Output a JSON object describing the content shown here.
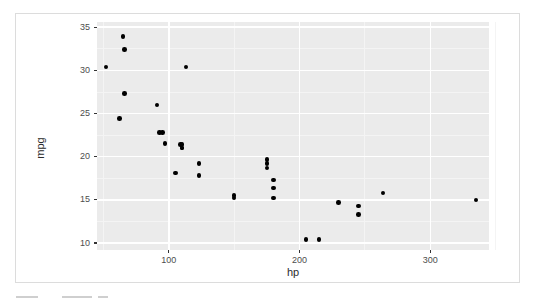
{
  "chart_data": {
    "type": "scatter",
    "title": "",
    "subtitle": "",
    "xlabel": "hp",
    "ylabel": "mpg",
    "xlim": [
      45,
      345
    ],
    "ylim": [
      9.2,
      35.6
    ],
    "x_ticks": [
      100,
      200,
      300
    ],
    "x_tick_labels": [
      "100",
      "200",
      "300"
    ],
    "y_ticks": [
      10,
      15,
      20,
      25,
      30,
      35
    ],
    "y_tick_labels": [
      "10",
      "15",
      "20",
      "25",
      "30",
      "35"
    ],
    "x_minor_ticks": [
      50,
      150,
      250,
      350
    ],
    "y_minor_ticks": [
      12.5,
      17.5,
      22.5,
      27.5,
      32.5
    ],
    "grid": true,
    "legend": "none",
    "point_color": "#000000",
    "point_size": 4.6,
    "panel_background": "#ebebeb",
    "gridline_color": "#ffffff",
    "series": [
      {
        "name": "mtcars",
        "x": [
          110,
          110,
          93,
          110,
          175,
          105,
          245,
          62,
          95,
          123,
          123,
          180,
          180,
          180,
          205,
          215,
          230,
          66,
          52,
          65,
          97,
          150,
          150,
          245,
          175,
          66,
          91,
          113,
          264,
          175,
          335,
          109
        ],
        "y": [
          21.0,
          21.0,
          22.8,
          21.4,
          18.7,
          18.1,
          14.3,
          24.4,
          22.8,
          19.2,
          17.8,
          16.4,
          17.3,
          15.2,
          10.4,
          10.4,
          14.7,
          32.4,
          30.4,
          33.9,
          21.5,
          15.5,
          15.2,
          13.3,
          19.2,
          27.3,
          26.0,
          30.4,
          15.8,
          19.7,
          15.0,
          21.4
        ]
      }
    ]
  },
  "figure": {
    "axis_title_x": "hp",
    "axis_title_y": "mpg"
  },
  "footer": {
    "artifact_note": ""
  }
}
